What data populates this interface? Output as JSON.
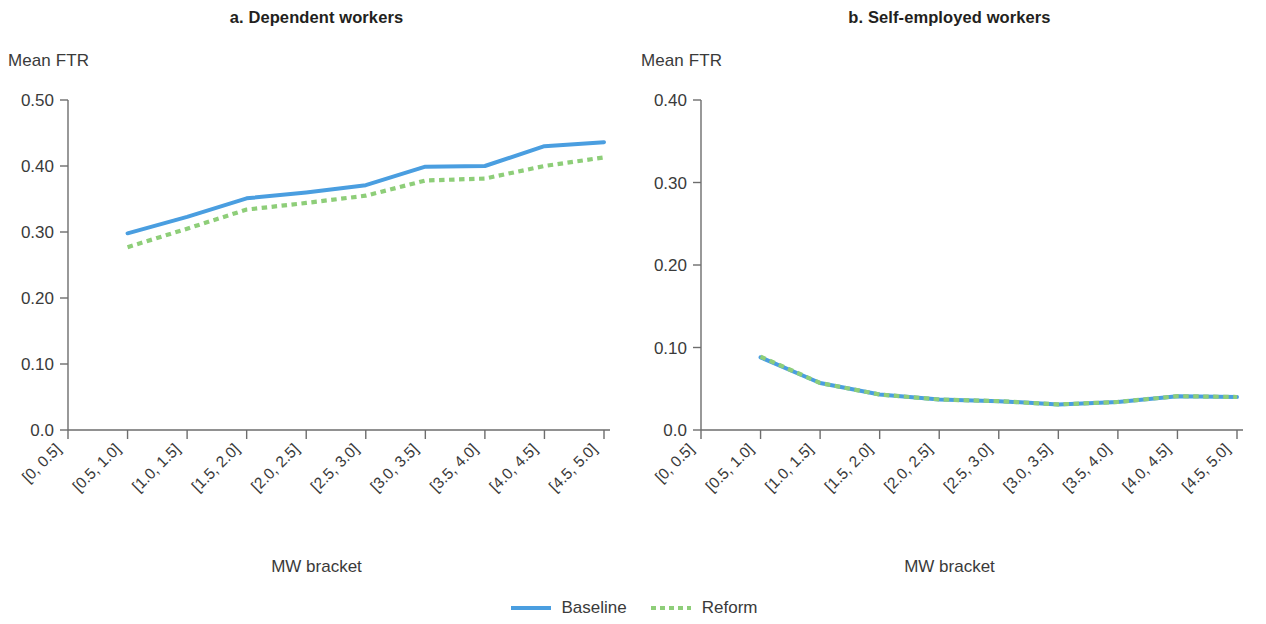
{
  "figure": {
    "legend": {
      "position": "bottom-center",
      "entries": [
        {
          "label": "Baseline",
          "color": "#4a9ee0",
          "style": "solid"
        },
        {
          "label": "Reform",
          "color": "#8ece79",
          "style": "dotted"
        }
      ]
    }
  },
  "chart_data": [
    {
      "type": "line",
      "panel_id": "a",
      "title": "a. Dependent workers",
      "xlabel": "MW bracket",
      "ylabel": "Mean FTR",
      "grid": false,
      "ylim": [
        0.0,
        0.5
      ],
      "ytick_labels": [
        "0.50",
        "0.40",
        "0.30",
        "0.20",
        "0.10",
        "0.0"
      ],
      "ytick_values": [
        0.5,
        0.4,
        0.3,
        0.2,
        0.1,
        0.0
      ],
      "categories": [
        "[0, 0.5]",
        "[0.5, 1.0]",
        "[1.0, 1.5]",
        "[1.5, 2.0]",
        "[2.0, 2.5]",
        "[2.5, 3.0]",
        "[3.0, 3.5]",
        "[3.5, 4.0]",
        "[4.0, 4.5]",
        "[4.5, 5.0]"
      ],
      "series": [
        {
          "name": "Baseline",
          "color": "#4a9ee0",
          "style": "solid",
          "values": [
            null,
            0.298,
            0.323,
            0.351,
            0.36,
            0.371,
            0.399,
            0.4,
            0.43,
            0.436
          ]
        },
        {
          "name": "Reform",
          "color": "#8ece79",
          "style": "dotted",
          "values": [
            null,
            0.277,
            0.305,
            0.334,
            0.344,
            0.355,
            0.378,
            0.381,
            0.4,
            0.413
          ]
        }
      ]
    },
    {
      "type": "line",
      "panel_id": "b",
      "title": "b. Self-employed workers",
      "xlabel": "MW bracket",
      "ylabel": "Mean FTR",
      "grid": false,
      "ylim": [
        0.0,
        0.4
      ],
      "ytick_labels": [
        "0.40",
        "0.30",
        "0.20",
        "0.10",
        "0.0"
      ],
      "ytick_values": [
        0.4,
        0.3,
        0.2,
        0.1,
        0.0
      ],
      "categories": [
        "[0, 0.5]",
        "[0.5, 1.0]",
        "[1.0, 1.5]",
        "[1.5, 2.0]",
        "[2.0, 2.5]",
        "[2.5, 3.0]",
        "[3.0, 3.5]",
        "[3.5, 4.0]",
        "[4.0, 4.5]",
        "[4.5, 5.0]"
      ],
      "series": [
        {
          "name": "Baseline",
          "color": "#4a9ee0",
          "style": "solid",
          "values": [
            null,
            0.088,
            0.057,
            0.043,
            0.037,
            0.035,
            0.031,
            0.034,
            0.041,
            0.04
          ]
        },
        {
          "name": "Reform",
          "color": "#8ece79",
          "style": "dotted",
          "values": [
            null,
            0.089,
            0.057,
            0.043,
            0.037,
            0.035,
            0.031,
            0.034,
            0.041,
            0.04
          ]
        }
      ]
    }
  ]
}
